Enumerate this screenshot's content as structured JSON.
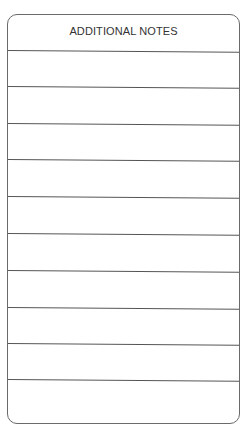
{
  "form": {
    "title": "ADDITIONAL NOTES",
    "line_count": 10
  }
}
